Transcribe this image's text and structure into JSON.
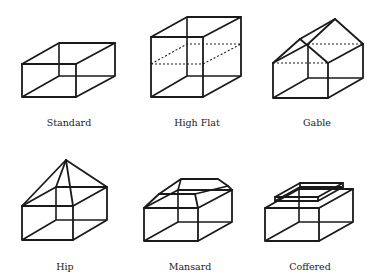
{
  "figure": {
    "title": "",
    "items": [
      {
        "id": "standard",
        "label": "Standard",
        "row": 1,
        "col": 1
      },
      {
        "id": "high-flat",
        "label": "High Flat",
        "row": 1,
        "col": 2
      },
      {
        "id": "gable",
        "label": "Gable",
        "row": 1,
        "col": 3
      },
      {
        "id": "hip",
        "label": "Hip",
        "row": 2,
        "col": 1
      },
      {
        "id": "mansard",
        "label": "Mansard",
        "row": 2,
        "col": 2
      },
      {
        "id": "coffered",
        "label": "Coffered",
        "row": 2,
        "col": 3
      }
    ]
  },
  "colors": {
    "line": "#1a1a1a",
    "background": "#ffffff",
    "text": "#222222"
  }
}
